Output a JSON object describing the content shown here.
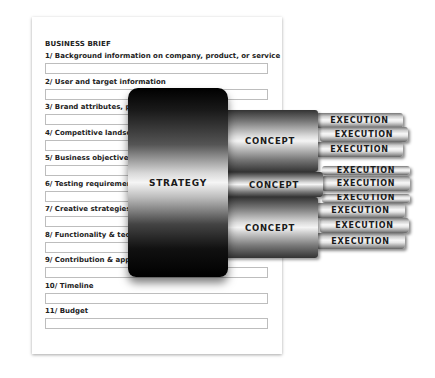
{
  "brief": {
    "title": "BUSINESS BRIEF",
    "rows": [
      {
        "label": "1/ Background information on company, product, or service"
      },
      {
        "label": "2/ User and target information"
      },
      {
        "label": "3/ Brand attributes, pro"
      },
      {
        "label": "4/ Competitive landsca"
      },
      {
        "label": "5/ Business objectives a"
      },
      {
        "label": "6/ Testing requirement"
      },
      {
        "label": "7/ Creative strategies"
      },
      {
        "label": "8/ Functionality & techn"
      },
      {
        "label": "9/ Contribution & appro"
      },
      {
        "label": "10/ Timeline"
      },
      {
        "label": "11/ Budget"
      }
    ]
  },
  "diagram": {
    "strategy_label": "STRATEGY",
    "concepts": [
      "CONCEPT",
      "CONCEPT",
      "CONCEPT"
    ],
    "execution_label": "EXECUTION"
  }
}
